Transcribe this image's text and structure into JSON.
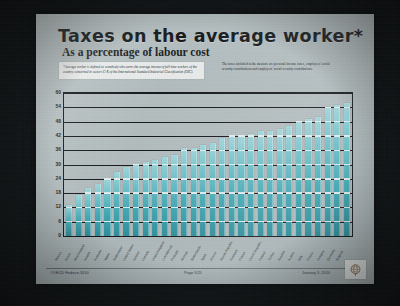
{
  "slide": {
    "title": "Taxes on the average worker*",
    "subtitle": "As a percentage of labour cost",
    "note_left": "*Average worker is defined as somebody who earns the average income of full-time workers of the country concerned in sectors C-K of the International Standard Industrial Classification (ISIC).",
    "note_right": "The taxes included in the measure are personal income taxes, employees' social security contributions and employers' social security contributions."
  },
  "footer": {
    "copyright": "©OECD Fedisco 2010",
    "page": "Page 5/25",
    "date": "January 3, 2010",
    "logo_name": "globe-logo"
  },
  "chart_data": {
    "type": "bar",
    "title": "Taxes on the average worker*",
    "subtitle": "As a percentage of labour cost",
    "xlabel": "",
    "ylabel": "",
    "ylim": [
      0,
      60
    ],
    "ytick_step": 6,
    "yticks": [
      0,
      6,
      12,
      18,
      24,
      30,
      36,
      42,
      48,
      54,
      60
    ],
    "grid": true,
    "legend": "none",
    "bar_color": "#4fb2bd",
    "categories": [
      "Mexico",
      "Korea",
      "New Zealand",
      "Ireland",
      "Australia",
      "Japan",
      "Switzerland",
      "United States",
      "Iceland",
      "Canada",
      "United Kingdom",
      "Luxembourg",
      "Portugal",
      "Norway",
      "Netherlands",
      "Spain",
      "Greece",
      "Slovak Republic",
      "Denmark",
      "Poland",
      "Czech Republic",
      "Finland",
      "Turkey",
      "Sweden",
      "Austria",
      "Italy",
      "France",
      "Hungary",
      "Germany",
      "Belgium"
    ],
    "values": [
      13,
      17,
      20,
      22,
      24,
      27,
      29,
      30,
      31,
      32,
      33,
      34,
      37,
      37,
      38,
      39,
      41,
      42,
      42,
      43,
      44,
      44,
      45,
      46,
      48,
      49,
      50,
      54,
      55,
      56
    ]
  }
}
